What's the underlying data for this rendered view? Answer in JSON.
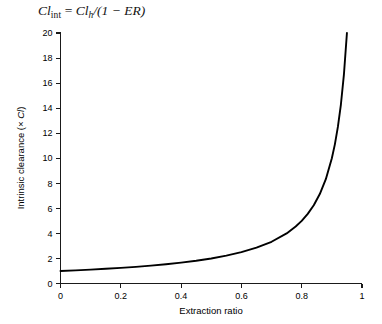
{
  "equation": {
    "lhs_main": "Cl",
    "lhs_sub": "int",
    "equals": " = ",
    "rhs_main": "Cl",
    "rhs_sub": "h",
    "rhs_rest": "/(1 − ER)",
    "full_text": "Cl_int = Cl_h/(1 − ER)"
  },
  "chart_data": {
    "type": "line",
    "title": "",
    "xlabel": "Extraction ratio",
    "ylabel": "Intrinsic clearance (× Cl)",
    "ylabel_prefix": "Intrinsic clearance (× ",
    "ylabel_italic": "Cl",
    "ylabel_suffix": ")",
    "xlim": [
      0,
      1
    ],
    "ylim": [
      0,
      20
    ],
    "xticks": [
      0,
      0.2,
      0.4,
      0.6,
      0.8,
      1
    ],
    "xtick_labels": [
      "0",
      "0.2",
      "0.4",
      "0.6",
      "0.8",
      "1"
    ],
    "yticks": [
      0,
      2,
      4,
      6,
      8,
      10,
      12,
      14,
      16,
      18,
      20
    ],
    "ytick_labels": [
      "0",
      "2",
      "4",
      "6",
      "8",
      "10",
      "12",
      "14",
      "16",
      "18",
      "20"
    ],
    "grid": false,
    "legend": false,
    "legend_position": "none",
    "line_color": "#000000",
    "axis_color": "#1a1a1a",
    "background_color": "#ffffff",
    "series": [
      {
        "name": "Cl_int = Cl_h/(1 - ER)",
        "formula": "y = 1/(1 - x)",
        "x": [
          0.0,
          0.05,
          0.1,
          0.15,
          0.2,
          0.25,
          0.3,
          0.35,
          0.4,
          0.45,
          0.5,
          0.55,
          0.6,
          0.65,
          0.7,
          0.75,
          0.78,
          0.8,
          0.82,
          0.84,
          0.86,
          0.88,
          0.9,
          0.91,
          0.92,
          0.93,
          0.94,
          0.95
        ],
        "values": [
          1.0,
          1.05,
          1.11,
          1.18,
          1.25,
          1.33,
          1.43,
          1.54,
          1.67,
          1.82,
          2.0,
          2.22,
          2.5,
          2.86,
          3.33,
          4.0,
          4.55,
          5.0,
          5.56,
          6.25,
          7.14,
          8.33,
          10.0,
          11.11,
          12.5,
          14.29,
          16.67,
          20.0
        ]
      }
    ]
  }
}
